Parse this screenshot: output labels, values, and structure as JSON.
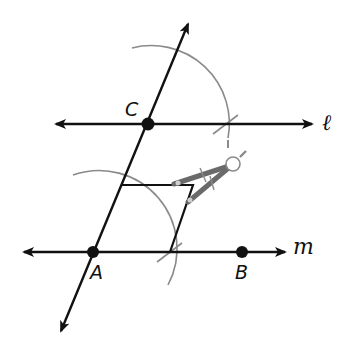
{
  "figure": {
    "colors": {
      "ink": "#111111",
      "arc": "#8a8a8a",
      "compass": "#6a6a6a"
    }
  },
  "points": [
    {
      "label": "A",
      "x": 93,
      "y": 252
    },
    {
      "label": "B",
      "x": 242,
      "y": 252
    },
    {
      "label": "C",
      "x": 148,
      "y": 124
    }
  ],
  "lines": [
    {
      "label": "ℓ",
      "type": "line",
      "through": "C",
      "y": 124,
      "x_start": 56,
      "x_end": 312
    },
    {
      "label": "m",
      "type": "line",
      "through": [
        "A",
        "B"
      ],
      "y": 252,
      "x_start": 24,
      "x_end": 285
    },
    {
      "label": "",
      "type": "transversal",
      "through": [
        "A",
        "C"
      ],
      "from": [
        61,
        331
      ],
      "to": [
        188,
        24
      ]
    }
  ],
  "labels": {
    "point_A": "A",
    "point_B": "B",
    "point_C": "C",
    "line_l": "ℓ",
    "line_m": "m"
  },
  "tools": [
    {
      "name": "compass",
      "hinge": [
        232,
        165
      ]
    }
  ]
}
